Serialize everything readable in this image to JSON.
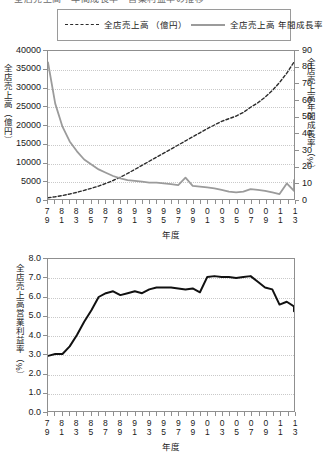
{
  "header_clipped_text": "全店売上高・年間成長率・営業利益率の推移",
  "legend": {
    "items": [
      {
        "marker": "dashed-line-swatch",
        "line1": "全店売上高",
        "line2": "（億円）"
      },
      {
        "marker": "solid-line-swatch",
        "line1": "全店売上高",
        "line2": "年間成長率"
      }
    ]
  },
  "colors": {
    "sales_line": "#2b2b2b",
    "growth_line": "#9b9b9b",
    "margin_line": "#111111",
    "axis": "#8f8f8f",
    "grid": "#c9c9c9"
  },
  "xaxis": {
    "title": "年度",
    "labels_top": [
      "7",
      "8",
      "8",
      "8",
      "8",
      "8",
      "9",
      "9",
      "9",
      "9",
      "9",
      "0",
      "0",
      "0",
      "0",
      "0",
      "1",
      "1"
    ],
    "labels_bottom": [
      "9",
      "1",
      "3",
      "5",
      "7",
      "9",
      "1",
      "3",
      "5",
      "7",
      "9",
      "1",
      "3",
      "5",
      "7",
      "9",
      "1",
      "3"
    ],
    "years": [
      1979,
      1981,
      1983,
      1985,
      1987,
      1989,
      1991,
      1993,
      1995,
      1997,
      1999,
      2001,
      2003,
      2005,
      2007,
      2009,
      2011,
      2013
    ]
  },
  "chart_data": [
    {
      "type": "line",
      "id": "chart-sales-growth",
      "title": "",
      "xlabel": "年度",
      "ylabel": "全店売上高（億円）",
      "y2label": "全店売上高年間成長率（%）",
      "ylim": [
        0,
        40000
      ],
      "yticks": [
        0,
        5000,
        10000,
        15000,
        20000,
        25000,
        30000,
        35000,
        40000
      ],
      "y2lim": [
        0,
        90
      ],
      "y2ticks": [
        0,
        10,
        20,
        30,
        40,
        50,
        60,
        70,
        80,
        90
      ],
      "xlim": [
        1979,
        2013
      ],
      "grid": true,
      "legend_position": "top",
      "x": [
        1979,
        1980,
        1981,
        1982,
        1983,
        1984,
        1985,
        1986,
        1987,
        1988,
        1989,
        1990,
        1991,
        1992,
        1993,
        1994,
        1995,
        1996,
        1997,
        1998,
        1999,
        2000,
        2001,
        2002,
        2003,
        2004,
        2005,
        2006,
        2007,
        2008,
        2009,
        2010,
        2011,
        2012,
        2013
      ],
      "series": [
        {
          "name": "全店売上高（億円）",
          "axis": "left",
          "style": "dashed",
          "color": "#2b2b2b",
          "values": [
            350,
            600,
            950,
            1350,
            1800,
            2350,
            2900,
            3500,
            4200,
            5000,
            5900,
            6900,
            8000,
            9100,
            10200,
            11300,
            12400,
            13500,
            14600,
            15700,
            16800,
            17900,
            19000,
            20000,
            21000,
            21700,
            22400,
            23400,
            24800,
            26000,
            27500,
            29300,
            31500,
            34000,
            37000
          ]
        },
        {
          "name": "全店売上高年間成長率（%）",
          "axis": "right",
          "style": "solid",
          "color": "#9b9b9b",
          "values": [
            83,
            58,
            44,
            35,
            29,
            24,
            21,
            18,
            16,
            14,
            12.5,
            11.5,
            11,
            10.5,
            10,
            10,
            9.5,
            9,
            8.5,
            13,
            8,
            7.5,
            7,
            6.5,
            5.5,
            4.5,
            4,
            4.5,
            6,
            5.5,
            5,
            4,
            3,
            9.5,
            5,
            11.5
          ]
        }
      ]
    },
    {
      "type": "line",
      "id": "chart-operating-margin",
      "title": "",
      "xlabel": "年度",
      "ylabel": "全店売上高営業利益率（%）",
      "ylim": [
        0,
        8
      ],
      "yticks": [
        0.0,
        1.0,
        2.0,
        3.0,
        4.0,
        5.0,
        6.0,
        7.0,
        8.0
      ],
      "ytick_labels": [
        "0.0",
        "1.0",
        "2.0",
        "3.0",
        "4.0",
        "5.0",
        "6.0",
        "7.0",
        "8.0"
      ],
      "xlim": [
        1979,
        2013
      ],
      "grid": true,
      "x": [
        1979,
        1980,
        1981,
        1982,
        1983,
        1984,
        1985,
        1986,
        1987,
        1988,
        1989,
        1990,
        1991,
        1992,
        1993,
        1994,
        1995,
        1996,
        1997,
        1998,
        1999,
        2000,
        2001,
        2002,
        2003,
        2004,
        2005,
        2006,
        2007,
        2008,
        2009,
        2010,
        2011,
        2012,
        2013
      ],
      "series": [
        {
          "name": "全店売上高営業利益率（%）",
          "axis": "left",
          "style": "solid",
          "color": "#111111",
          "values": [
            2.9,
            3.0,
            3.0,
            3.4,
            4.0,
            4.7,
            5.3,
            6.0,
            6.2,
            6.3,
            6.1,
            6.2,
            6.3,
            6.2,
            6.4,
            6.5,
            6.5,
            6.5,
            6.45,
            6.4,
            6.45,
            6.25,
            7.05,
            7.1,
            7.05,
            7.05,
            7.0,
            7.05,
            7.1,
            6.8,
            6.5,
            6.4,
            5.6,
            5.75,
            5.5,
            5.25
          ]
        }
      ]
    }
  ]
}
